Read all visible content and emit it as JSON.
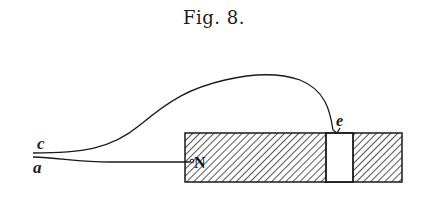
{
  "figure": {
    "title": "Fig. 8.",
    "labels": {
      "wire_c": "c",
      "wire_a": "a",
      "pole": "N",
      "contact": "e"
    },
    "colors": {
      "ink": "#1a1a1a",
      "background": "#ffffff"
    }
  }
}
